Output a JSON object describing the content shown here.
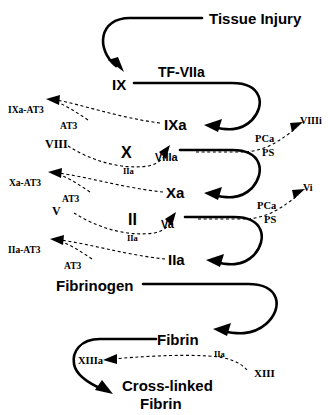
{
  "diagram": {
    "type": "flow-diagram",
    "background_color": "#ffffff",
    "line_color": "#000000"
  },
  "nodes": {
    "tissue_injury": "Tissue Injury",
    "tf_viia": "TF-VIIa",
    "ix": "IX",
    "ixa": "IXa",
    "ixa_at3": "IXa-AT3",
    "at3_ix": "AT3",
    "viii": "VIII",
    "viiia": "VIIIa",
    "iia_viii": "IIa",
    "x": "X",
    "xa": "Xa",
    "xa_at3": "Xa-AT3",
    "at3_x": "AT3",
    "pca_1": "PCa",
    "ps_1": "PS",
    "viiii": "VIIIi",
    "v": "V",
    "va": "Va",
    "iia_v": "IIa",
    "ii": "II",
    "iia": "IIa",
    "iia_at3": "IIa-AT3",
    "at3_ii": "AT3",
    "pca_2": "PCa",
    "ps_2": "PS",
    "vi": "Vi",
    "fibrinogen": "Fibrinogen",
    "fibrin": "Fibrin",
    "xiii": "XIII",
    "xiiia": "XIIIa",
    "iia_xiii": "IIa",
    "crosslinked_line1": "Cross-linked",
    "crosslinked_line2": "Fibrin"
  }
}
